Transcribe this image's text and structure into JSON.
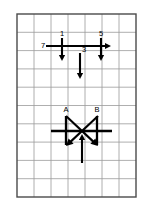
{
  "figure": {
    "background_color": "#ffffff",
    "grid": {
      "line_color": "#9a9a9a",
      "border_color": "#4a4a4a",
      "columns": 7,
      "rows": 10,
      "left": 17,
      "top": 14,
      "width": 119,
      "height": 183
    },
    "vector_color": "#000000",
    "upper_group": {
      "name": "upper-vector-group",
      "horizontal_arrow": {
        "label": "7",
        "direction": "right",
        "label_x": 43,
        "label_y": 48,
        "x1": 46,
        "y1": 46,
        "x2": 111,
        "y2": 46
      },
      "down_arrows": [
        {
          "label": "1",
          "direction": "down",
          "label_x": 62,
          "label_y": 36,
          "x": 62,
          "y1": 38,
          "y2": 61
        },
        {
          "label": "5",
          "direction": "down",
          "label_x": 101,
          "label_y": 36,
          "x": 101,
          "y1": 38,
          "y2": 61
        },
        {
          "label": "3",
          "direction": "down",
          "label_x": 84,
          "label_y": 52,
          "x": 80,
          "y1": 53,
          "y2": 79
        }
      ]
    },
    "lower_group": {
      "name": "lower-vector-group",
      "bars": [
        {
          "label": "A",
          "label_x": 66,
          "label_y": 112,
          "x": 66,
          "y1": 116,
          "y2": 145
        },
        {
          "label": "B",
          "label_x": 97,
          "label_y": 112,
          "x": 97,
          "y1": 116,
          "y2": 145
        }
      ],
      "horizontal_line": {
        "x1": 51,
        "y1": 131,
        "x2": 112,
        "y2": 131
      },
      "diagonal_arrows": [
        {
          "direction": "down-left",
          "x1": 98,
          "y1": 116,
          "x2": 66,
          "y2": 146
        },
        {
          "direction": "down-right",
          "x1": 66,
          "y1": 116,
          "x2": 98,
          "y2": 146
        }
      ],
      "up_arrow": {
        "direction": "up",
        "x": 82,
        "y1": 163,
        "y2": 134
      }
    }
  }
}
